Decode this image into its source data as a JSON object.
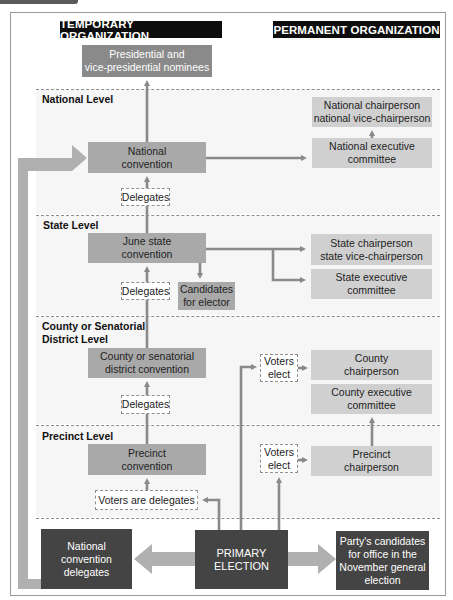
{
  "headers": {
    "temporary": "TEMPORARY ORGANIZATION",
    "permanent": "PERMANENT ORGANIZATION"
  },
  "levels": {
    "national": "National Level",
    "state": "State Level",
    "county": "County or Senatorial\nDistrict Level",
    "precinct": "Precinct Level"
  },
  "temporary": {
    "nominees": "Presidential and\nvice-presidential nominees",
    "national_convention": "National\nconvention",
    "state_convention": "June state\nconvention",
    "candidates_for_elector": "Candidates\nfor elector",
    "county_convention": "County or senatorial\ndistrict convention",
    "precinct_convention": "Precinct\nconvention"
  },
  "permanent": {
    "national_chair": "National  chairperson\nnational vice-chairperson",
    "national_exec": "National executive\ncommittee",
    "state_chair": "State chairperson\nstate vice-chairperson",
    "state_exec": "State executive\ncommittee",
    "county_chair": "County\nchairperson",
    "county_exec": "County executive\ncommittee",
    "precinct_chair": "Precinct\nchairperson"
  },
  "connectors": {
    "delegates_national": "Delegates",
    "delegates_state": "Delegates",
    "delegates_county": "Delegates",
    "voters_are_delegates": "Voters are delegates",
    "voters_elect_county": "Voters\nelect",
    "voters_elect_precinct": "Voters\nelect"
  },
  "bottom": {
    "national_convention_delegates": "National\nconvention\ndelegates",
    "primary_election": "PRIMARY\nELECTION",
    "party_candidates": "Party's candidates\nfor office in the\nNovember general\nelection"
  },
  "colors": {
    "header_bg": "#0d0d0d",
    "temporary_box": "#8a8a8a",
    "permanent_box": "#d0d0d0",
    "bottom_box": "#444444",
    "arrow": "#8a8a8a",
    "big_arrow": "#b0b0b0"
  }
}
